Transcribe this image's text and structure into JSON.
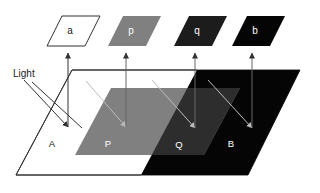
{
  "figure": {
    "title_label": "Light",
    "background_color": "#ffffff",
    "line_color": "#333333",
    "ray_dark_color": "#b0b0b0",
    "colors": {
      "white": "#ffffff",
      "gray": "#808080",
      "dark_gray": "#2a2a2a",
      "black": "#050505",
      "outline": "#333333",
      "text_on_light": "#1a1a1a",
      "text_on_dark": "#ffffff"
    },
    "patches": [
      {
        "id": "patch-a",
        "label": "a",
        "fill": "#ffffff",
        "text_color": "#1a1a1a",
        "stroke": "#333333",
        "points": "47,46 62,16 100,16 85,46"
      },
      {
        "id": "patch-p",
        "label": "p",
        "fill": "#808080",
        "text_color": "#ffffff",
        "stroke": "none",
        "points": "108,46 123,16 161,16 146,46"
      },
      {
        "id": "patch-q",
        "label": "q",
        "fill": "#1c1c1c",
        "text_color": "#ffffff",
        "stroke": "none",
        "points": "174,46 189,16 227,16 212,46"
      },
      {
        "id": "patch-b",
        "label": "b",
        "fill": "#050505",
        "text_color": "#ffffff",
        "stroke": "none",
        "points": "232,46 247,16 285,16 270,46"
      }
    ],
    "surface": {
      "base_points": "16,175 72,70 300,70 248,175",
      "lit_region_label": "A",
      "shadow_region_label": "B",
      "inner_lit_label": "P",
      "inner_shadow_label": "Q"
    },
    "region_labels": [
      {
        "id": "label-A",
        "text": "A",
        "x": 52,
        "y": 144,
        "color": "#1a1a1a"
      },
      {
        "id": "label-P",
        "text": "P",
        "x": 108,
        "y": 144,
        "color": "#ffffff"
      },
      {
        "id": "label-Q",
        "text": "Q",
        "x": 179,
        "y": 145,
        "color": "#ffffff"
      },
      {
        "id": "label-B",
        "text": "B",
        "x": 231,
        "y": 144,
        "color": "#ffffff"
      }
    ],
    "light_label": {
      "text": "Light",
      "x": 13,
      "y": 74
    }
  }
}
